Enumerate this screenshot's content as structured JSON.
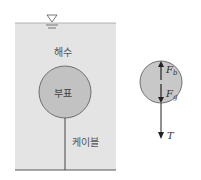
{
  "diagram": {
    "left": {
      "water_label": "해수",
      "buoy_label": "부표",
      "cable_label": "케이블",
      "free_surface_icon": "free-surface-triangle"
    },
    "right": {
      "force_buoyancy": "F",
      "force_buoyancy_sub": "b",
      "force_gravity": "F",
      "force_gravity_sub": "g",
      "tension": "T"
    },
    "colors": {
      "water": "#e4e4e4",
      "buoy": "#c2c2c2",
      "outline": "#555555"
    }
  }
}
